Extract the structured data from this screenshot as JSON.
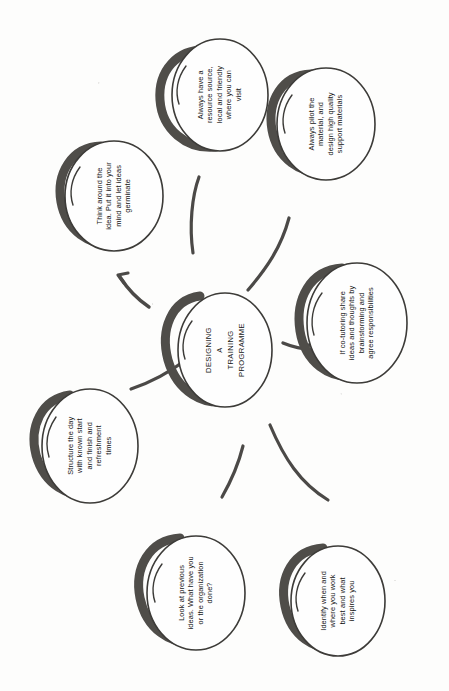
{
  "document": {
    "title": "DESIGNING A TRAINING PROGRAMME",
    "kind": "hand-drawn mind map (scanned, rotated 90 degrees)",
    "orientation": "text rotated 90 degrees counter-clockwise",
    "background_color": "#fdfdfc",
    "ink_color": "#3a3936",
    "shadow_color": "#4a4845",
    "text_color": "#151515"
  },
  "center": {
    "id": "center-node",
    "text": "DESIGNING\nA\nTRAINING\nPROGRAMME",
    "line1": "DESIGNING",
    "line2": "A",
    "line3": "TRAINING",
    "line4": "PROGRAMME"
  },
  "branches": [
    {
      "id": "branch-resource-source",
      "name": "always-have-a-resource-source",
      "text": "Always have a\nresource source,\nlocal and friendly\nwhere you can\nvisit"
    },
    {
      "id": "branch-pilot-material",
      "name": "always-pilot-the-material",
      "text": "Always pilot the\nmaterial, and\ndesign high quality\nsupport materials"
    },
    {
      "id": "branch-think-around-idea",
      "name": "think-around-the-idea",
      "text": "Think around the\nidea. Put it into your\nmind and let ideas\ngerminate"
    },
    {
      "id": "branch-co-tutoring",
      "name": "if-co-tutoring-share-ideas",
      "text": "If co-tutoring share\nideas and thoughts by\nbrainstorming and\nagree responsibilities"
    },
    {
      "id": "branch-structure-the-day",
      "name": "structure-the-day",
      "text": "Structure the day\nwith known start\nand finish and\nrefreshment\ntimes"
    },
    {
      "id": "branch-look-at-previous-ideas",
      "name": "look-at-previous-ideas",
      "text": "Look at previous\nideas. What have you\nor the organization\ndone?"
    },
    {
      "id": "branch-identify-when-and-where",
      "name": "identify-when-and-where-you-work-best",
      "text": "Identify when and\nwhere you work\nbest and what\ninspires you"
    }
  ],
  "connectors": [
    {
      "id": "connector-to-think-around-idea",
      "has_arrowhead": true
    },
    {
      "id": "connector-to-resource-source",
      "has_arrowhead": false
    },
    {
      "id": "connector-to-pilot-material",
      "has_arrowhead": false
    },
    {
      "id": "connector-to-co-tutoring",
      "has_arrowhead": true
    },
    {
      "id": "connector-to-structure-the-day",
      "has_arrowhead": false
    },
    {
      "id": "connector-to-look-at-previous-ideas",
      "has_arrowhead": false
    },
    {
      "id": "connector-to-identify-when-and-where",
      "has_arrowhead": false
    }
  ]
}
